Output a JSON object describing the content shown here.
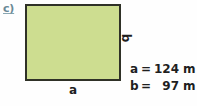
{
  "exercise": {
    "item_label": "c)",
    "item_label_color": "#6a8a96"
  },
  "figure": {
    "type": "rectangle",
    "fill_color": "#cddd90",
    "stroke_color": "#2f3127",
    "labels": {
      "width_side": "a",
      "height_side": "b"
    }
  },
  "measurements": [
    {
      "variable": "a",
      "equals": "=",
      "value": "124",
      "unit": "m"
    },
    {
      "variable": "b",
      "equals": "=",
      "value": "97",
      "unit": "m"
    }
  ]
}
